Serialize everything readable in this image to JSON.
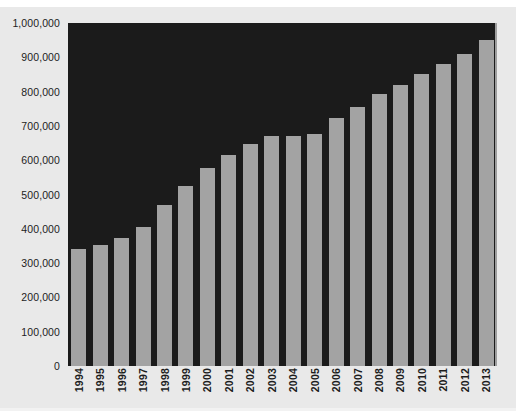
{
  "chart_data": {
    "type": "bar",
    "title": "",
    "subtitle": "",
    "xlabel": "",
    "ylabel": "",
    "categories": [
      "1994",
      "1995",
      "1996",
      "1997",
      "1998",
      "1999",
      "2000",
      "2001",
      "2002",
      "2003",
      "2004",
      "2005",
      "2006",
      "2007",
      "2008",
      "2009",
      "2010",
      "2011",
      "2012",
      "2013"
    ],
    "values": [
      340000,
      352000,
      372000,
      405000,
      468000,
      525000,
      578000,
      615000,
      648000,
      672000,
      672000,
      675000,
      722000,
      755000,
      792000,
      820000,
      852000,
      880000,
      910000,
      950000
    ],
    "ylim": [
      0,
      1000000
    ],
    "ytick_values": [
      0,
      100000,
      200000,
      300000,
      400000,
      500000,
      600000,
      700000,
      800000,
      900000,
      1000000
    ],
    "ytick_labels": [
      "0",
      "100,000",
      "200,000",
      "300,000",
      "400,000",
      "500,000",
      "600,000",
      "700,000",
      "800,000",
      "900,000",
      "1,000,000"
    ],
    "grid": false,
    "legend": null,
    "legend_position": "none",
    "colors": {
      "bar_fill": "#a3a3a3",
      "plot_background": "#1b1b1b",
      "figure_background": "#e9e9e9",
      "text": "#1d1d1d",
      "axis_line": "#9e9e9e"
    }
  }
}
